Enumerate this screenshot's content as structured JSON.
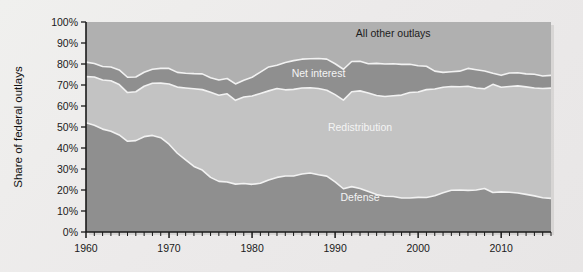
{
  "chart_data": {
    "type": "area",
    "stacked": true,
    "title": "",
    "subtitle": "",
    "xlabel": "",
    "ylabel": "Share of federal outlays",
    "xlim": [
      1960,
      2016
    ],
    "ylim": [
      0,
      100
    ],
    "y_tick_labels": [
      "0%",
      "10%",
      "20%",
      "30%",
      "40%",
      "50%",
      "60%",
      "70%",
      "80%",
      "90%",
      "100%"
    ],
    "y_tick_values": [
      0,
      10,
      20,
      30,
      40,
      50,
      60,
      70,
      80,
      90,
      100
    ],
    "x_tick_labels": [
      "1960",
      "1970",
      "1980",
      "1990",
      "2000",
      "2010"
    ],
    "x_tick_values": [
      1960,
      1970,
      1980,
      1990,
      2000,
      2010
    ],
    "minor_x_ticks": "annual",
    "grid": false,
    "legend_position": "inline-band-labels",
    "colors": {
      "defense": "#8f8f8f",
      "redistribution": "#c3c3c3",
      "net_interest": "#8f8f8f",
      "all_other_outlays": "#b0b0b0",
      "separator": "#f2f2f2",
      "axis": "#1a1a1a",
      "background": "#ebeae8"
    },
    "x": [
      1960,
      1961,
      1962,
      1963,
      1964,
      1965,
      1966,
      1967,
      1968,
      1969,
      1970,
      1971,
      1972,
      1973,
      1974,
      1975,
      1976,
      1977,
      1978,
      1979,
      1980,
      1981,
      1982,
      1983,
      1984,
      1985,
      1986,
      1987,
      1988,
      1989,
      1990,
      1991,
      1992,
      1993,
      1994,
      1995,
      1996,
      1997,
      1998,
      1999,
      2000,
      2001,
      2002,
      2003,
      2004,
      2005,
      2006,
      2007,
      2008,
      2009,
      2010,
      2011,
      2012,
      2013,
      2014,
      2015,
      2016
    ],
    "series": [
      {
        "name": "Defense",
        "label": "Defense",
        "color": "#8f8f8f",
        "values": [
          52.0,
          50.8,
          49.0,
          48.0,
          46.2,
          43.2,
          43.5,
          45.4,
          46.0,
          44.9,
          41.8,
          37.5,
          34.3,
          31.2,
          29.5,
          26.0,
          24.1,
          23.8,
          22.8,
          23.1,
          22.7,
          23.2,
          24.8,
          26.0,
          26.7,
          26.7,
          27.6,
          28.1,
          27.3,
          26.6,
          23.9,
          20.6,
          21.6,
          20.7,
          19.3,
          17.9,
          17.0,
          16.9,
          16.2,
          16.2,
          16.5,
          16.4,
          17.3,
          18.7,
          19.9,
          20.0,
          19.8,
          20.0,
          20.7,
          18.8,
          19.1,
          18.9,
          18.6,
          17.9,
          17.2,
          16.3,
          16.0
        ]
      },
      {
        "name": "Redistribution",
        "label": "Redistribution",
        "color": "#c3c3c3",
        "values": [
          22.0,
          23.0,
          23.4,
          24.0,
          24.0,
          23.2,
          23.3,
          24.0,
          24.8,
          26.0,
          28.7,
          31.5,
          34.3,
          37.0,
          38.3,
          40.5,
          41.0,
          42.0,
          39.9,
          41.2,
          42.1,
          42.8,
          42.4,
          42.3,
          41.0,
          41.2,
          41.0,
          40.6,
          41.0,
          40.9,
          41.5,
          42.2,
          45.2,
          46.5,
          46.9,
          47.1,
          47.5,
          48.0,
          49.0,
          50.2,
          50.2,
          51.4,
          50.8,
          50.2,
          49.4,
          49.2,
          49.6,
          48.6,
          47.5,
          51.5,
          49.8,
          50.4,
          51.0,
          51.2,
          51.4,
          52.0,
          52.5
        ]
      },
      {
        "name": "Net interest",
        "label": "Net interest",
        "color": "#8f8f8f",
        "values": [
          6.9,
          6.4,
          6.4,
          6.6,
          7.0,
          7.3,
          7.0,
          6.7,
          6.7,
          7.0,
          7.4,
          7.0,
          7.0,
          7.2,
          7.5,
          7.0,
          7.3,
          7.3,
          7.8,
          8.0,
          8.9,
          10.1,
          11.4,
          11.1,
          13.0,
          13.7,
          13.7,
          13.8,
          14.3,
          14.8,
          14.7,
          14.7,
          14.4,
          14.1,
          13.9,
          15.3,
          15.5,
          15.2,
          14.6,
          13.5,
          12.5,
          11.1,
          8.5,
          7.1,
          7.0,
          7.4,
          8.5,
          8.7,
          8.5,
          5.3,
          5.7,
          6.4,
          6.2,
          6.2,
          6.5,
          6.0,
          6.1
        ]
      },
      {
        "name": "All other outlays",
        "label": "All other outlays",
        "color": "#b0b0b0",
        "values": [
          19.1,
          19.8,
          21.2,
          21.4,
          22.8,
          26.3,
          26.2,
          23.9,
          22.5,
          22.1,
          22.1,
          24.0,
          24.4,
          24.6,
          24.7,
          26.5,
          27.6,
          26.9,
          29.5,
          27.7,
          26.3,
          23.9,
          21.4,
          20.6,
          19.3,
          18.4,
          17.7,
          17.5,
          17.4,
          17.7,
          19.9,
          22.5,
          18.8,
          18.7,
          19.9,
          19.7,
          20.0,
          19.9,
          20.2,
          20.1,
          20.8,
          21.1,
          23.4,
          24.0,
          23.7,
          23.4,
          22.1,
          22.7,
          23.3,
          24.4,
          25.4,
          24.3,
          24.2,
          24.7,
          24.9,
          25.7,
          25.4
        ]
      }
    ],
    "band_labels": [
      {
        "name": "all-other-outlays-label",
        "text": "All other outlays",
        "x": 1997,
        "y": 93,
        "tone": "dark"
      },
      {
        "name": "net-interest-label",
        "text": "Net interest",
        "x": 1988,
        "y": 74,
        "tone": "light"
      },
      {
        "name": "redistribution-label",
        "text": "Redistribution",
        "x": 1993,
        "y": 48,
        "tone": "light"
      },
      {
        "name": "defense-label",
        "text": "Defense",
        "x": 1993,
        "y": 15,
        "tone": "light"
      }
    ]
  }
}
